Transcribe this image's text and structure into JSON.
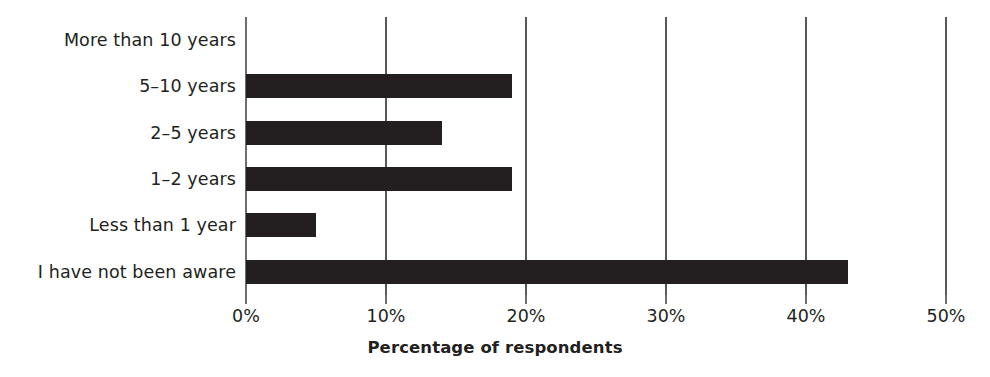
{
  "chart_data": {
    "type": "bar",
    "orientation": "horizontal",
    "title": "",
    "subtitle": "",
    "xlabel": "Percentage of respondents",
    "ylabel": "",
    "categories": [
      "More than 10 years",
      "5–10 years",
      "2–5 years",
      "1–2 years",
      "Less than 1 year",
      "I have not been aware"
    ],
    "values": [
      0,
      19,
      14,
      19,
      5,
      43
    ],
    "value_unit": "%",
    "xlim": [
      0,
      50
    ],
    "x_ticks": [
      0,
      10,
      20,
      30,
      40,
      50
    ],
    "x_tick_labels": [
      "0%",
      "10%",
      "20%",
      "30%",
      "40%",
      "50%"
    ],
    "grid": "vertical",
    "legend": "none",
    "bar_color": "#231f20",
    "axis_color": "#6d6e71",
    "background_color": "#ffffff"
  }
}
